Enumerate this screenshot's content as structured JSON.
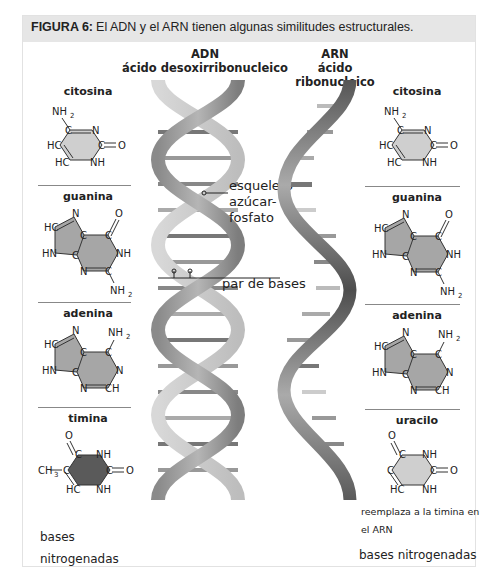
{
  "figure": {
    "label": "FIGURA 6:",
    "caption": "El ADN y el ARN tienen algunas similitudes estructurales."
  },
  "dna": {
    "title": "ADN",
    "subtitle": "ácido desoxirribonucleico"
  },
  "rna": {
    "title": "ARN",
    "subtitle": "ácido ribonucleico"
  },
  "annotations": {
    "backbone_line1": "esqueleto",
    "backbone_line2": "azúcar-",
    "backbone_line3": "fosfato",
    "base_pair": "par de bases"
  },
  "left_bases": [
    {
      "name": "citosina"
    },
    {
      "name": "guanina"
    },
    {
      "name": "adenina"
    },
    {
      "name": "timina"
    }
  ],
  "right_bases": [
    {
      "name": "citosina"
    },
    {
      "name": "guanina"
    },
    {
      "name": "adenina"
    },
    {
      "name": "uracilo"
    }
  ],
  "uracil_note_line1": "reemplaza a la timina en",
  "uracil_note_line2": "el ARN",
  "left_footer_line1": "bases",
  "left_footer_line2": "nitrogenadas",
  "right_footer": "bases nitrogenadas",
  "colors": {
    "header_bg": "#e6e6e6",
    "pyrimidine_fill": "#cfcfcf",
    "purine_fill": "#a6a6a6",
    "thymine_fill": "#5a5a5a",
    "helix_light": "#d0d0d0",
    "helix_dark": "#7a7a7a"
  }
}
